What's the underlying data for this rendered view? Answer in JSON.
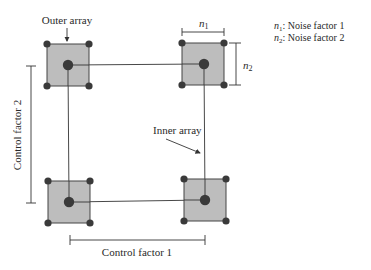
{
  "labels": {
    "outer_array": "Outer array",
    "inner_array": "Inner array",
    "control_factor_1": "Control factor 1",
    "control_factor_2": "Control factor 2",
    "n1": "n",
    "n1_sub": "1",
    "n2": "n",
    "n2_sub": "2"
  },
  "legend": [
    {
      "symbol": "n",
      "sub": "1",
      "text": ": Noise factor 1"
    },
    {
      "symbol": "n",
      "sub": "2",
      "text": ": Noise factor 2"
    }
  ],
  "colors": {
    "square_fill": "#bdbdbd",
    "square_stroke": "#444444",
    "dot": "#3a3a3a",
    "line": "#333333"
  }
}
